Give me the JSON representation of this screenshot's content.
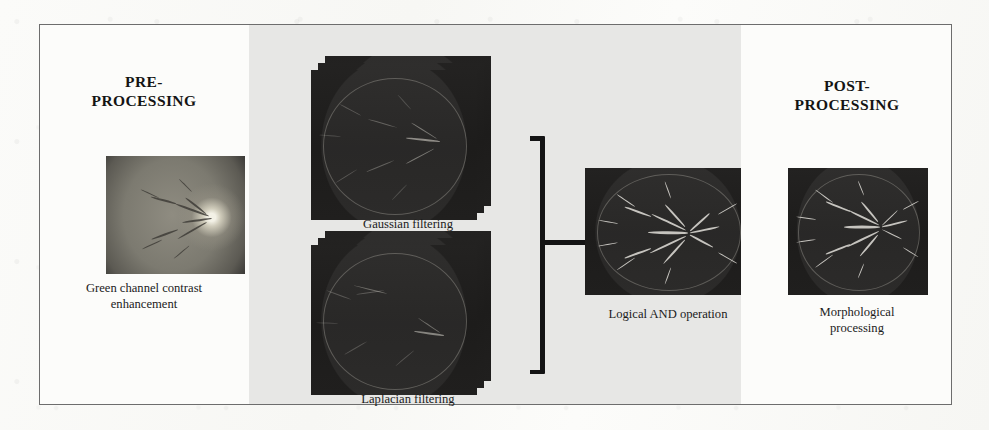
{
  "figure": {
    "type": "pipeline-diagram",
    "stages": [
      {
        "id": "pre",
        "title": "PRE-\nPROCESSING",
        "title_line1": "PRE-",
        "title_line2": "PROCESSING",
        "caption": "Green channel contrast enhancement",
        "caption_line1": "Green channel contrast",
        "caption_line2": "enhancement",
        "image_name": "fundus-green-channel-enhanced",
        "panel_background": "#fcfcfa"
      },
      {
        "id": "processing",
        "title": "PROCESSING",
        "title_line1": "PROCESSING",
        "title_line2": "",
        "panel_background": "#e7e7e5",
        "items": [
          {
            "id": "gaussian",
            "caption": "Gaussian filtering",
            "image_name": "gaussian-filtered-stack",
            "stack_layers": 3
          },
          {
            "id": "laplacian",
            "caption": "Laplacian filtering",
            "image_name": "laplacian-filtered-stack",
            "stack_layers": 3
          },
          {
            "id": "and",
            "caption": "Logical AND operation",
            "image_name": "logical-and-result"
          }
        ],
        "connector": "right-facing-bracket"
      },
      {
        "id": "post",
        "title": "POST-\nPROCESSING",
        "title_line1": "POST-",
        "title_line2": "PROCESSING",
        "caption": "Morphological processing",
        "caption_line1": "Morphological",
        "caption_line2": "processing",
        "image_name": "morphologically-processed-vessels",
        "panel_background": "#fcfcfa"
      }
    ],
    "colors": {
      "frame_border": "#6d6d6d",
      "processing_panel": "#e7e7e5",
      "page_background": "#fdfdfb",
      "ink": "#141414"
    }
  },
  "bleed_through": {
    "caption_ghost": "scanned reverse-page show-through text",
    "heading_ghost": "scanned reverse-page heading show-through"
  }
}
